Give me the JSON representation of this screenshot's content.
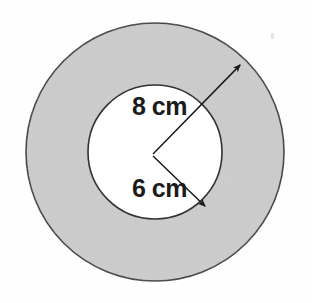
{
  "figure": {
    "background_color": "#fefefe",
    "labels": {
      "outer_radius": "8 cm",
      "inner_radius": "6 cm"
    },
    "colors": {
      "ring_fill": "#cdcdcd",
      "inner_fill": "#ffffff",
      "stroke": "#333333",
      "text": "#1b1b1b",
      "speck": "#e4e4e4"
    }
  },
  "chart_data": {
    "type": "diagram",
    "subtype": "annulus",
    "units": "cm",
    "center": {
      "x": 155,
      "y": 152
    },
    "shapes": [
      {
        "name": "outer-circle",
        "kind": "circle",
        "radius_px": 129,
        "radius_value": 8,
        "fill": "#cdcdcd",
        "stroke": "#333333"
      },
      {
        "name": "inner-circle",
        "kind": "circle",
        "radius_px": 67,
        "radius_value": 6,
        "fill": "#ffffff",
        "stroke": "#333333"
      }
    ],
    "annotations": [
      {
        "name": "outer-radius-arrow",
        "label": "8 cm",
        "value": 8,
        "from": {
          "x": 153,
          "y": 154
        },
        "to": {
          "x": 243,
          "y": 62
        },
        "arrowhead": "end",
        "points_to": "outer-circle"
      },
      {
        "name": "inner-radius-arrow",
        "label": "6 cm",
        "value": 6,
        "from": {
          "x": 153,
          "y": 156
        },
        "to": {
          "x": 208,
          "y": 209
        },
        "arrowhead": "end",
        "points_to": "inner-circle"
      }
    ],
    "legend": null,
    "grid": false
  }
}
